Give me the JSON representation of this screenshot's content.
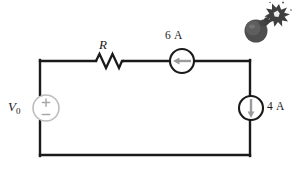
{
  "figure": {
    "kind": "circuit-diagram",
    "background_color": "#ffffff",
    "wire_color": "#1a1a1a",
    "source_outline_color": "#1a1a1a",
    "voltage_source_color": "#b8b8b8",
    "arrow_color": "#9a9a9a",
    "bomb_color": "#4a4a4a"
  },
  "labels": {
    "resistor": "R",
    "voltage_source": "V",
    "voltage_source_subscript": "0",
    "top_current_source": "6 A",
    "right_current_source": "4 A",
    "polarity_plus": "+",
    "polarity_minus": "−"
  },
  "components": [
    {
      "name": "voltage-source",
      "type": "independent-voltage-source",
      "label": "V0",
      "position": "left-branch",
      "center": [
        46,
        108
      ],
      "radius": 13,
      "polarity_top": "+",
      "polarity_bottom": "−"
    },
    {
      "name": "resistor",
      "type": "resistor",
      "label": "R",
      "position": "top-branch-left",
      "span_x": [
        96,
        124
      ],
      "center_y": 61
    },
    {
      "name": "current-source-6a",
      "type": "independent-current-source",
      "label": "6 A",
      "value": 6,
      "unit": "A",
      "position": "top-branch-right",
      "center": [
        182,
        61
      ],
      "radius": 12,
      "arrow_direction": "left"
    },
    {
      "name": "current-source-4a",
      "type": "independent-current-source",
      "label": "4 A",
      "value": 4,
      "unit": "A",
      "position": "right-branch",
      "center": [
        251,
        108
      ],
      "radius": 12,
      "arrow_direction": "down"
    },
    {
      "name": "bomb-icon",
      "type": "decoration",
      "label": "",
      "position": "top-right-corner",
      "center": [
        266,
        24
      ]
    }
  ],
  "loop": {
    "left": 40,
    "right": 250,
    "top": 61,
    "bottom": 155
  }
}
